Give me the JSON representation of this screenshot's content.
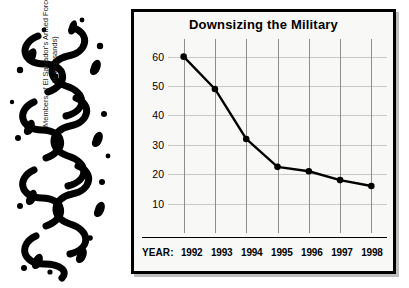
{
  "ornament": {
    "name": "decorative-squiggle-illustration",
    "ink_color": "#000000"
  },
  "chart_panel": {
    "title": "Downsizing the Military",
    "border_color": "#000000",
    "background_color": "#f8f8f6",
    "year_caption": "YEAR:"
  },
  "chart_data": {
    "type": "line",
    "title": "Downsizing the Military",
    "xlabel": "YEAR:",
    "ylabel": "Members of El Salvador's Armed Forces (in thousands)",
    "ylabel_line1": "Members of El Salvador's Armed Forces",
    "ylabel_line2": "(in thousands)",
    "categories": [
      "1992",
      "1993",
      "1994",
      "1995",
      "1996",
      "1997",
      "1998"
    ],
    "values": [
      60,
      49,
      32,
      22.5,
      21,
      18,
      16
    ],
    "yticks": [
      60,
      50,
      40,
      30,
      20,
      10
    ],
    "ylim": [
      0,
      66
    ],
    "grid": true,
    "legend": "none",
    "series_color": "#000000",
    "marker": "circle",
    "gridline_color_horizontal": "#c9c9c9",
    "gridline_color_vertical": "#8e8e8e"
  },
  "footnote": {
    "text": ""
  }
}
